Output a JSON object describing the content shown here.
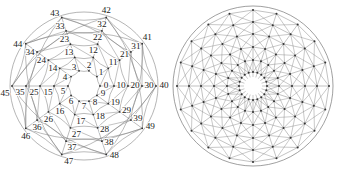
{
  "figure_panel": {
    "background_color": "#ffffff",
    "edge_color": "#777777",
    "node_color": "#333333",
    "label_color": "#1a1a1a"
  },
  "chart_data": [
    {
      "type": "diagram",
      "name": "labeled-circular-graph",
      "title": "",
      "layout": "concentric-rings",
      "center": [
        84,
        86
      ],
      "rings": 5,
      "nodes_per_ring": 10,
      "ring_radii": [
        16,
        30,
        44,
        58,
        72
      ],
      "ring_start_angle_deg": 0,
      "angle_step_deg": -36,
      "node_count": 50,
      "labels": [
        "0",
        "1",
        "2",
        "3",
        "4",
        "5",
        "6",
        "7",
        "8",
        "9",
        "10",
        "11",
        "12",
        "13",
        "14",
        "15",
        "16",
        "17",
        "18",
        "19",
        "20",
        "21",
        "22",
        "23",
        "24",
        "25",
        "26",
        "27",
        "28",
        "29",
        "30",
        "31",
        "32",
        "33",
        "34",
        "35",
        "36",
        "37",
        "38",
        "39",
        "40",
        "41",
        "42",
        "43",
        "44",
        "45",
        "46",
        "47",
        "48",
        "49"
      ],
      "label_offsets": [
        [
          6,
          -1
        ],
        [
          4,
          -5
        ],
        [
          0,
          -6
        ],
        [
          -5,
          -4
        ],
        [
          -6,
          0
        ],
        [
          -5,
          5
        ],
        [
          0,
          6
        ],
        [
          5,
          5
        ],
        [
          6,
          1
        ],
        [
          6,
          -2
        ],
        [
          7,
          -1
        ],
        [
          5,
          -6
        ],
        [
          0,
          -7
        ],
        [
          -6,
          -5
        ],
        [
          -7,
          0
        ],
        [
          -6,
          6
        ],
        [
          0,
          7
        ],
        [
          6,
          6
        ],
        [
          7,
          1
        ],
        [
          7,
          -2
        ],
        [
          7,
          -1
        ],
        [
          5,
          -6
        ],
        [
          0,
          -7
        ],
        [
          -6,
          -5
        ],
        [
          -7,
          0
        ],
        [
          -6,
          6
        ],
        [
          0,
          7
        ],
        [
          6,
          6
        ],
        [
          7,
          1
        ],
        [
          7,
          -2
        ],
        [
          7,
          -1
        ],
        [
          5,
          -6
        ],
        [
          0,
          -7
        ],
        [
          -6,
          -5
        ],
        [
          -7,
          0
        ],
        [
          -6,
          6
        ],
        [
          0,
          7
        ],
        [
          6,
          6
        ],
        [
          7,
          1
        ],
        [
          7,
          -2
        ],
        [
          8,
          -1
        ],
        [
          5,
          -7
        ],
        [
          0,
          -8
        ],
        [
          -7,
          -5
        ],
        [
          -8,
          0
        ],
        [
          -7,
          7
        ],
        [
          0,
          8
        ],
        [
          7,
          7
        ],
        [
          8,
          1
        ],
        [
          8,
          -2
        ]
      ],
      "edge_types": [
        "radial-spokes",
        "ring-chords",
        "outer-circle"
      ],
      "chord_steps": [
        1,
        2
      ],
      "shows_node_labels": true
    },
    {
      "type": "diagram",
      "name": "unlabeled-circular-graph",
      "title": "",
      "layout": "concentric-rings",
      "center": [
        84,
        86
      ],
      "rings": 6,
      "nodes_per_ring": 20,
      "ring_radii": [
        14,
        26,
        39,
        52,
        64,
        76
      ],
      "ring_start_angle_deg": 0,
      "angle_step_deg": -18,
      "node_count": 120,
      "edge_types": [
        "radial-spokes",
        "ring-chords",
        "cross-ring-diagonals",
        "outer-circle"
      ],
      "chord_steps": [
        1
      ],
      "shows_node_labels": false,
      "center_hole_radius": 9
    }
  ]
}
